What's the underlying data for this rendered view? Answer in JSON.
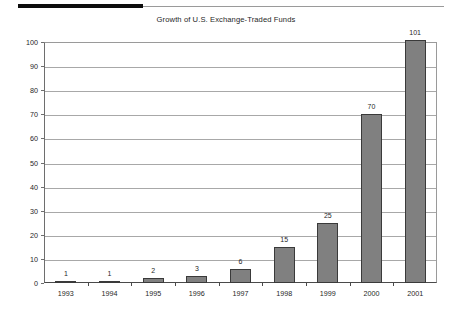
{
  "document": {
    "top_rule_thick_color": "#0d0d0d",
    "top_rule_thin_color": "#9a9a9a"
  },
  "chart_data": {
    "type": "bar",
    "title": "Growth of U.S. Exchange-Traded Funds",
    "xlabel": "",
    "ylabel": "",
    "categories": [
      "1993",
      "1994",
      "1995",
      "1996",
      "1997",
      "1998",
      "1999",
      "2000",
      "2001"
    ],
    "values": [
      1,
      1,
      2,
      3,
      6,
      15,
      25,
      70,
      101
    ],
    "data_labels": [
      "1",
      "1",
      "2",
      "3",
      "6",
      "15",
      "25",
      "70",
      "101"
    ],
    "ylim": [
      0,
      100
    ],
    "yticks": [
      0,
      10,
      20,
      30,
      40,
      50,
      60,
      70,
      80,
      90,
      100
    ],
    "ytick_labels": [
      "0",
      "10",
      "20",
      "30",
      "40",
      "50",
      "60",
      "70",
      "80",
      "90",
      "100"
    ],
    "grid": true,
    "legend": false,
    "bar_color": "#808080",
    "bar_edge_color": "#3a3a3a",
    "gridline_color": "#a8a8a8",
    "axis_color": "#4a4a4a",
    "background": "#ffffff"
  }
}
